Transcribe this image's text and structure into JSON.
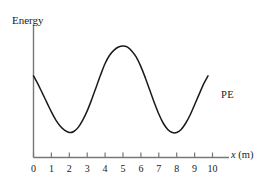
{
  "figure": {
    "kind": "potential-energy-graph",
    "background_color": "#ffffff",
    "line_color": "#1a1a1a"
  },
  "axes": {
    "y_axis_label": "Energy",
    "x_axis_label_italic": "x",
    "x_axis_label_unit": "(m)",
    "x_ticks": [
      "0",
      "1",
      "2",
      "3",
      "4",
      "5",
      "6",
      "7",
      "8",
      "9",
      "10"
    ],
    "y_ticks": [],
    "grid": false
  },
  "series_label": {
    "pe": "PE"
  },
  "chart_data": {
    "type": "line",
    "title": "",
    "xlabel": "x (m)",
    "ylabel": "Energy",
    "xlim": [
      0,
      10
    ],
    "ylim": [
      0,
      1
    ],
    "grid": false,
    "legend_position": "inline-right",
    "series": [
      {
        "name": "PE",
        "x": [
          0.0,
          0.25,
          0.5,
          0.75,
          1.0,
          1.25,
          1.5,
          1.75,
          2.0,
          2.25,
          2.5,
          2.75,
          3.0,
          3.25,
          3.5,
          3.75,
          4.0,
          4.25,
          4.5,
          4.75,
          5.0,
          5.25,
          5.5,
          5.75,
          6.0,
          6.25,
          6.5,
          6.75,
          7.0,
          7.25,
          7.5,
          7.75,
          8.0,
          8.25,
          8.5,
          8.75,
          9.0,
          9.25,
          9.5,
          9.75
        ],
        "y": [
          0.71,
          0.63,
          0.54,
          0.45,
          0.36,
          0.28,
          0.22,
          0.18,
          0.16,
          0.17,
          0.21,
          0.28,
          0.37,
          0.48,
          0.6,
          0.72,
          0.83,
          0.91,
          0.96,
          0.99,
          1.0,
          0.99,
          0.95,
          0.89,
          0.8,
          0.69,
          0.57,
          0.45,
          0.34,
          0.25,
          0.19,
          0.16,
          0.16,
          0.19,
          0.25,
          0.33,
          0.43,
          0.53,
          0.63,
          0.71
        ],
        "annotations": [
          {
            "label": "minimum",
            "x": 2.0
          },
          {
            "label": "maximum",
            "x": 5.0
          },
          {
            "label": "minimum",
            "x": 8.0
          }
        ]
      }
    ]
  }
}
